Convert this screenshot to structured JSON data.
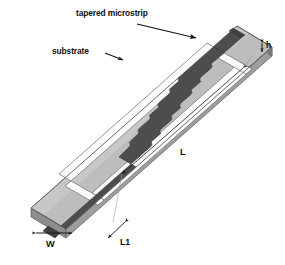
{
  "figure": {
    "background_color": "#ffffff",
    "view": "3d-oblique"
  },
  "labels": {
    "tapered_microstrip": "tapered microstrip",
    "substrate": "substrate",
    "thickness": "h",
    "length": "L",
    "width": "W",
    "feed_length": "L1"
  },
  "colors": {
    "background": "#ffffff",
    "substrate_top": "#b9b9b9",
    "substrate_top_light": "#c6c6c6",
    "substrate_edge_front": "#9a9a9a",
    "substrate_edge_side": "#8d8d8d",
    "substrate_edge_dark": "#7e7e7e",
    "slot_white": "#fdfdfd",
    "microstrip": "#4d4d4d",
    "microstrip_shadow": "#3f3f3f",
    "outline": "#5a5a5a",
    "leader_line": "#111111",
    "dimension_line": "#2b2b2b",
    "text": "#111111"
  },
  "annotations": [
    {
      "name": "tapered-microstrip",
      "label": "tapered microstrip",
      "leader": "long arrow pointing down-right to the dark strip near the top feed"
    },
    {
      "name": "substrate",
      "label": "substrate",
      "leader": "short arrow pointing down-right to the light gray slab surface"
    },
    {
      "name": "thickness",
      "label": "h",
      "leader": "small vertical double-headed arrow at the right slab edge"
    },
    {
      "name": "length",
      "label": "L",
      "leader": "long diagonal double-headed dimension line along the lower-right long edge"
    },
    {
      "name": "width",
      "label": "W",
      "leader": "horizontal double-headed dimension line across the near short edge"
    },
    {
      "name": "feed-length",
      "label": "L1",
      "leader": "short diagonal double-headed dimension line at the near right corner"
    }
  ],
  "geometry": {
    "description": "Rectangular dielectric slab drawn in oblique 3D. A rectangular ring-shaped light gray conductor frames a white etched slot. A dark gray stepped/scalloped tapered microstrip runs down the center axis and extends across both short edges as feed lines.",
    "notch_count": 7,
    "notch_shape": "semicircular",
    "strip_taper": "stepped width decreasing toward the center"
  }
}
